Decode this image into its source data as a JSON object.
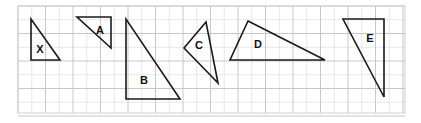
{
  "figure": {
    "width": 421,
    "height": 123,
    "background_color": "#ffffff"
  },
  "grid": {
    "x": 18,
    "y": 6,
    "width": 387,
    "height": 107,
    "cell_size": 13.75,
    "minor_line_color": "#dcdcdc",
    "major_line_color": "#c2c2c2",
    "major_every": 2,
    "border_color": "#d0d0d0"
  },
  "style": {
    "stroke_color": "#1a1a1a",
    "stroke_width": 1.6,
    "fill": "none",
    "label_color": "#111111",
    "label_font_size": 11
  },
  "shapes": [
    {
      "id": "triangle-x",
      "label": "X",
      "points": "31,19 31,60 60,60",
      "label_x": 40,
      "label_y": 50
    },
    {
      "id": "triangle-a",
      "label": "A",
      "points": "77,17 111,17 111,48",
      "label_x": 100,
      "label_y": 31
    },
    {
      "id": "triangle-b",
      "label": "B",
      "points": "126,19 126,99 180,99",
      "label_x": 144,
      "label_y": 81
    },
    {
      "id": "triangle-c",
      "label": "C",
      "points": "206,22 184,48 218,83",
      "label_x": 199,
      "label_y": 46
    },
    {
      "id": "triangle-d",
      "label": "D",
      "points": "248,21 325,60 230,60",
      "label_x": 258,
      "label_y": 45
    },
    {
      "id": "triangle-e",
      "label": "E",
      "points": "343,19 384,19 384,97",
      "label_x": 370,
      "label_y": 39
    }
  ]
}
